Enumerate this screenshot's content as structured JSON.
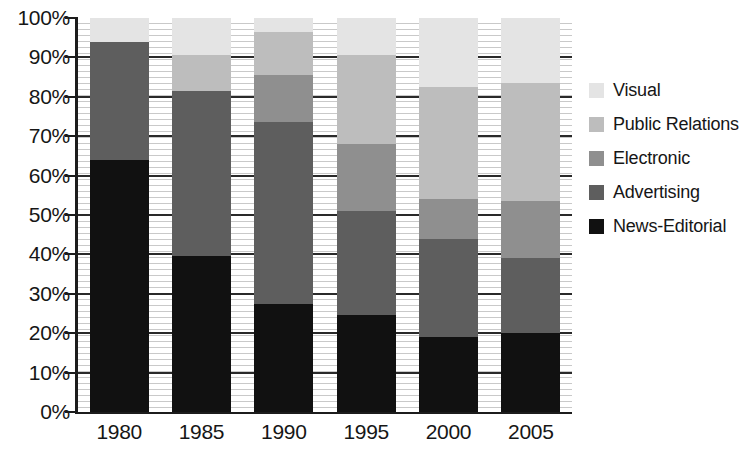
{
  "chart_data": {
    "type": "bar",
    "subtype": "stacked-percent",
    "title": "",
    "subtitle": "",
    "xlabel": "",
    "ylabel": "",
    "categories": [
      "1980",
      "1985",
      "1990",
      "1995",
      "2000",
      "2005"
    ],
    "ylim": [
      0,
      100
    ],
    "y_tick_labels": [
      "0%",
      "10%",
      "20%",
      "30%",
      "40%",
      "50%",
      "60%",
      "70%",
      "80%",
      "90%",
      "100%"
    ],
    "y_tick_values": [
      0,
      10,
      20,
      30,
      40,
      50,
      60,
      70,
      80,
      90,
      100
    ],
    "grid": true,
    "legend_position": "right",
    "stack_order_bottom_to_top": [
      "News-Editorial",
      "Advertising",
      "Electronic",
      "Public Relations",
      "Visual"
    ],
    "series": [
      {
        "name": "News-Editorial",
        "color": "#111111",
        "values": [
          64,
          39.5,
          27.5,
          24.5,
          19,
          20
        ]
      },
      {
        "name": "Advertising",
        "color": "#5e5e5e",
        "values": [
          30,
          42,
          46,
          26.5,
          25,
          19
        ]
      },
      {
        "name": "Electronic",
        "color": "#8f8f8f",
        "values": [
          0,
          0,
          12,
          17,
          10,
          14.5
        ]
      },
      {
        "name": "Public Relations",
        "color": "#bdbdbd",
        "values": [
          0,
          9,
          11,
          22.5,
          28.5,
          30
        ]
      },
      {
        "name": "Visual",
        "color": "#e4e4e4",
        "values": [
          6,
          9.5,
          3.5,
          9.5,
          17.5,
          16.5
        ]
      }
    ],
    "cumulative_tops": {
      "1980": {
        "News-Editorial": 64,
        "Advertising": 94,
        "Electronic": 94,
        "Public Relations": 94,
        "Visual": 100
      },
      "1985": {
        "News-Editorial": 39.5,
        "Advertising": 81.5,
        "Electronic": 81.5,
        "Public Relations": 90.5,
        "Visual": 100
      },
      "1990": {
        "News-Editorial": 27.5,
        "Advertising": 73.5,
        "Electronic": 85.5,
        "Public Relations": 96.5,
        "Visual": 100
      },
      "1995": {
        "News-Editorial": 24.5,
        "Advertising": 51,
        "Electronic": 68,
        "Public Relations": 90.5,
        "Visual": 100
      },
      "2000": {
        "News-Editorial": 19,
        "Advertising": 44,
        "Electronic": 54,
        "Public Relations": 82.5,
        "Visual": 100
      },
      "2005": {
        "News-Editorial": 20,
        "Advertising": 39,
        "Electronic": 53.5,
        "Public Relations": 83.5,
        "Visual": 100
      }
    }
  },
  "legend": {
    "items": [
      {
        "label": "Visual",
        "color": "#e4e4e4"
      },
      {
        "label": "Public Relations",
        "color": "#bdbdbd"
      },
      {
        "label": "Electronic",
        "color": "#8f8f8f"
      },
      {
        "label": "Advertising",
        "color": "#5e5e5e"
      },
      {
        "label": "News-Editorial",
        "color": "#111111"
      }
    ]
  },
  "colors": {
    "axis": "#1c1c1c",
    "gridline": "#2a2a2a",
    "hatch": "#c9c9c9",
    "background": "#ffffff",
    "text": "#161616"
  }
}
